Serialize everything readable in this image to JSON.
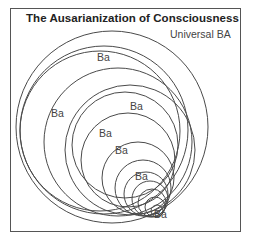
{
  "diagram": {
    "title": "The Ausarianization of Consciousness",
    "outer_label": "Universal BA",
    "stroke_color": "#4a4a4a",
    "circles": [
      {
        "cx": 112,
        "cy": 127,
        "r": 96
      },
      {
        "cx": 104,
        "cy": 130,
        "r": 84
      },
      {
        "cx": 100,
        "cy": 131,
        "r": 80
      },
      {
        "cx": 118,
        "cy": 142,
        "r": 74
      },
      {
        "cx": 130,
        "cy": 150,
        "r": 65
      },
      {
        "cx": 125,
        "cy": 145,
        "r": 53
      },
      {
        "cx": 128,
        "cy": 160,
        "r": 47
      },
      {
        "cx": 138,
        "cy": 178,
        "r": 36
      },
      {
        "cx": 143,
        "cy": 188,
        "r": 28
      },
      {
        "cx": 146,
        "cy": 194,
        "r": 22
      },
      {
        "cx": 150,
        "cy": 199,
        "r": 18
      },
      {
        "cx": 152,
        "cy": 203,
        "r": 14
      },
      {
        "cx": 155,
        "cy": 207,
        "r": 10
      },
      {
        "cx": 157,
        "cy": 211,
        "r": 6
      }
    ],
    "labels": [
      {
        "text": "Universal BA",
        "x": 170,
        "y": 38
      },
      {
        "text": "Ba",
        "x": 97,
        "y": 61
      },
      {
        "text": "Ba",
        "x": 51,
        "y": 117
      },
      {
        "text": "Ba",
        "x": 130,
        "y": 110
      },
      {
        "text": "Ba",
        "x": 99,
        "y": 137
      },
      {
        "text": "Ba",
        "x": 115,
        "y": 154
      },
      {
        "text": "Ba",
        "x": 135,
        "y": 180
      },
      {
        "text": "Ba",
        "x": 154,
        "y": 218
      }
    ]
  }
}
